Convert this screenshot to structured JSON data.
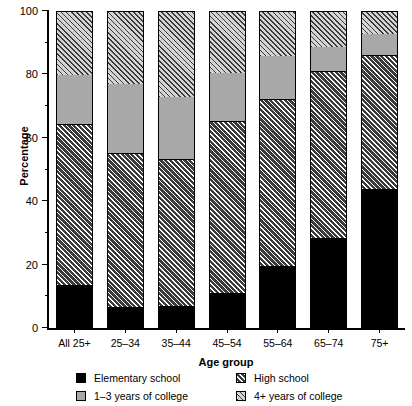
{
  "chart_data": {
    "type": "bar",
    "subtype": "stacked-bar-100",
    "title": "",
    "xlabel": "Age group",
    "ylabel": "Percentage",
    "ylim": [
      0,
      100
    ],
    "yticks": [
      0,
      20,
      40,
      60,
      80,
      100
    ],
    "ytick_labels": [
      "0",
      "20",
      "40",
      "60",
      "80",
      "100"
    ],
    "yminor_ticks": [
      10,
      30,
      50,
      70,
      90
    ],
    "grid": false,
    "legend_position": "bottom",
    "categories": [
      "All 25+",
      "25–34",
      "35–44",
      "45–54",
      "55–64",
      "65–74",
      "75+"
    ],
    "series": [
      {
        "name": "Elementary school",
        "fill": "solid-black",
        "color": "#000000",
        "values": [
          13,
          6,
          6.5,
          10.5,
          19,
          28,
          43.5
        ]
      },
      {
        "name": "High school",
        "fill": "dark-hatched",
        "color": "#3b3b3b",
        "values": [
          51,
          49,
          46.5,
          54.5,
          53,
          53,
          42.5
        ]
      },
      {
        "name": "1–3 years of college",
        "fill": "light-gray-solid",
        "color": "#a8a8a8",
        "values": [
          16,
          22,
          20,
          15.5,
          14,
          8,
          7
        ]
      },
      {
        "name": "4+ years of college",
        "fill": "light-hatched",
        "color": "#d4d4d4",
        "values": [
          20,
          23,
          27,
          19.5,
          14,
          11,
          7
        ]
      }
    ],
    "cumulative_tops": {
      "Elementary school": [
        13,
        6,
        6.5,
        10.5,
        19,
        28,
        43.5
      ],
      "High school": [
        64,
        55,
        53,
        65,
        72,
        81,
        86
      ],
      "1–3 years of college": [
        80,
        77,
        73,
        80.5,
        86,
        89,
        93
      ],
      "4+ years of college": [
        100,
        100,
        100,
        100,
        100,
        100,
        100
      ]
    }
  },
  "legend": {
    "items": [
      {
        "label": "Elementary school",
        "swatch": "solid-black"
      },
      {
        "label": "High school",
        "swatch": "dark-hatched"
      },
      {
        "label": "1–3 years of college",
        "swatch": "light-gray-solid"
      },
      {
        "label": "4+ years of college",
        "swatch": "light-hatched"
      }
    ]
  }
}
